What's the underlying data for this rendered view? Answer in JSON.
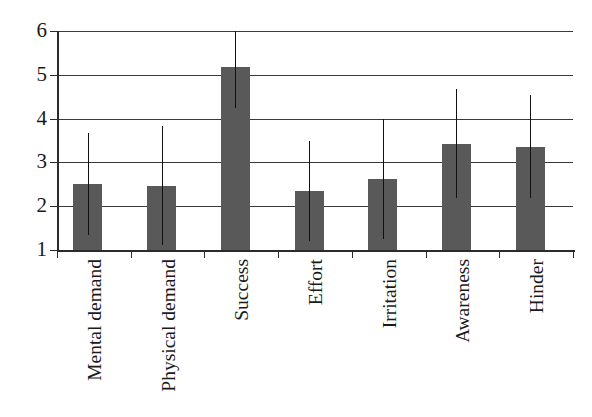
{
  "chart_data": {
    "type": "bar",
    "title": "",
    "subtitle": "",
    "xlabel": "",
    "ylabel": "",
    "ylim": [
      1,
      6
    ],
    "ytick_labels": [
      "1",
      "2",
      "3",
      "4",
      "5",
      "6"
    ],
    "yticks": [
      1,
      2,
      3,
      4,
      5,
      6
    ],
    "grid": true,
    "grid_axis": "y",
    "legend": false,
    "legend_position": "none",
    "error_bars": true,
    "error_bar_style": "line-no-caps",
    "bar_color": "#595959",
    "error_bar_color": "#111111",
    "axis_color": "#2b2b2b",
    "background_color": "#ffffff",
    "categories": [
      "Mental demand",
      "Physical demand",
      "Success",
      "Effort",
      "Irritation",
      "Awareness",
      "Hinder"
    ],
    "values": [
      2.5,
      2.47,
      5.18,
      2.35,
      2.62,
      3.42,
      3.36
    ],
    "error_low": [
      1.35,
      1.12,
      4.25,
      1.2,
      1.25,
      2.18,
      2.18
    ],
    "error_high": [
      3.68,
      3.84,
      6.0,
      3.5,
      4.0,
      4.67,
      4.55
    ],
    "points": [
      {
        "category": "Mental demand",
        "value": 2.5,
        "low": 1.35,
        "high": 3.68
      },
      {
        "category": "Physical demand",
        "value": 2.47,
        "low": 1.12,
        "high": 3.84
      },
      {
        "category": "Success",
        "value": 5.18,
        "low": 4.25,
        "high": 6.0
      },
      {
        "category": "Effort",
        "value": 2.35,
        "low": 1.2,
        "high": 3.5
      },
      {
        "category": "Irritation",
        "value": 2.62,
        "low": 1.25,
        "high": 4.0
      },
      {
        "category": "Awareness",
        "value": 3.42,
        "low": 2.18,
        "high": 4.67
      },
      {
        "category": "Hinder",
        "value": 3.36,
        "low": 2.18,
        "high": 4.55
      }
    ]
  }
}
